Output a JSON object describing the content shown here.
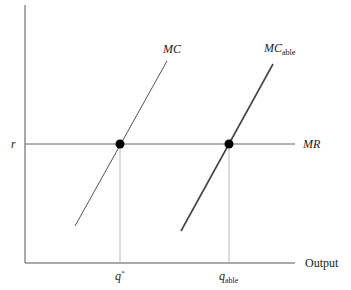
{
  "diagram": {
    "y_axis_label": "r",
    "x_axis_label": "Output",
    "curves": [
      {
        "name": "MC",
        "label_main": "MC",
        "label_sub": ""
      },
      {
        "name": "MC_able",
        "label_main": "MC",
        "label_sub": "able"
      }
    ],
    "horizontal_line": {
      "label": "MR"
    },
    "x_ticks": [
      {
        "label_main": "q",
        "label_sup": "*"
      },
      {
        "label_main": "q",
        "label_sub": "able"
      }
    ],
    "colors": {
      "axis": "#555555",
      "curve": "#555555",
      "curve_bold": "#333333",
      "guide": "#aaaaaa",
      "dot": "#000000"
    }
  }
}
